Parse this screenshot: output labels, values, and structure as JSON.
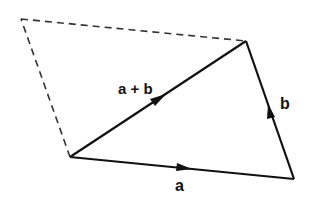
{
  "diagram": {
    "type": "vector-addition-parallelogram",
    "colors": {
      "stroke": "#111111",
      "background": "#ffffff"
    },
    "vertices": {
      "origin": [
        70,
        157
      ],
      "a_tip": [
        294,
        179
      ],
      "sum_tip": [
        246,
        41
      ],
      "b_translated_tip": [
        21,
        19
      ]
    },
    "labels": {
      "vector_a": "a",
      "vector_b": "b",
      "vector_sum": "a + b"
    }
  }
}
